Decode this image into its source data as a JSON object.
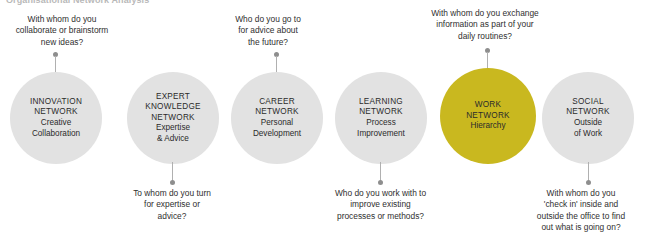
{
  "header": {
    "title": "Organisational Network Analysis"
  },
  "colors": {
    "node_default": "#e2e2e2",
    "node_highlight": "#c9b81f",
    "connector": "#8e8e8e",
    "text": "#2f2f2f",
    "background": "#ffffff"
  },
  "nodes": [
    {
      "id": "innovation-network",
      "title": "INNOVATION\nNETWORK",
      "subtitle": "Creative\nCollaboration",
      "highlighted": false
    },
    {
      "id": "expert-knowledge-network",
      "title": "EXPERT\nKNOWLEDGE\nNETWORK",
      "subtitle": "Expertise\n& Advice",
      "highlighted": false
    },
    {
      "id": "career-network",
      "title": "CAREER\nNETWORK",
      "subtitle": "Personal\nDevelopment",
      "highlighted": false
    },
    {
      "id": "learning-network",
      "title": "LEARNING\nNETWORK",
      "subtitle": "Process\nImprovement",
      "highlighted": false
    },
    {
      "id": "work-network",
      "title": "WORK\nNETWORK",
      "subtitle": "Hierarchy",
      "highlighted": true
    },
    {
      "id": "social-network",
      "title": "SOCIAL\nNETWORK",
      "subtitle": "Outside\nof Work",
      "highlighted": false
    }
  ],
  "captions": [
    {
      "id": "caption-innovation",
      "position": "above",
      "text": "With whom do you\ncollaborate or brainstorm\nnew ideas?"
    },
    {
      "id": "caption-expert-knowledge",
      "position": "below",
      "text": "To whom do you turn\nfor expertise or\nadvice?"
    },
    {
      "id": "caption-career",
      "position": "above",
      "text": "Who do you go to\nfor advice about\nthe future?"
    },
    {
      "id": "caption-learning",
      "position": "below",
      "text": "Who do you work with to\nimprove existing\nprocesses or methods?"
    },
    {
      "id": "caption-work",
      "position": "above",
      "text": "With whom do you exchange\ninformation as part of your\ndaily routines?"
    },
    {
      "id": "caption-social",
      "position": "below",
      "text": "With whom do you\n'check in' inside and\noutside the office to find\nout what is going on?"
    }
  ]
}
